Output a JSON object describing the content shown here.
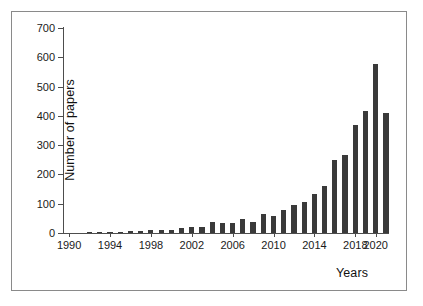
{
  "chart_data": {
    "type": "bar",
    "title": "",
    "xlabel": "Years",
    "ylabel": "Number of papers",
    "ylim": [
      0,
      700
    ],
    "ytick_values": [
      0,
      100,
      200,
      300,
      400,
      500,
      600,
      700
    ],
    "ytick_labels": [
      "0",
      "100",
      "200",
      "300",
      "400",
      "500",
      "600",
      "700"
    ],
    "xtick_labels": [
      "1990",
      "1994",
      "1998",
      "2002",
      "2006",
      "2010",
      "2014",
      "2018",
      "2020"
    ],
    "xtick_years": [
      1990,
      1994,
      1998,
      2002,
      2006,
      2010,
      2014,
      2018,
      2020
    ],
    "xlim": [
      1989.4,
      2021.2
    ],
    "grid": false,
    "legend": null,
    "bar_color": "#3a3a3a",
    "axis_color": "#4d4d4d",
    "frame_color": "#8a8a8a",
    "background": "#ffffff",
    "categories": [
      "1990",
      "1991",
      "1992",
      "1993",
      "1994",
      "1995",
      "1996",
      "1997",
      "1998",
      "1999",
      "2000",
      "2001",
      "2002",
      "2003",
      "2004",
      "2005",
      "2006",
      "2007",
      "2008",
      "2009",
      "2010",
      "2011",
      "2012",
      "2013",
      "2014",
      "2015",
      "2016",
      "2017",
      "2018",
      "2019",
      "2020",
      "2021"
    ],
    "values": [
      0,
      0,
      1,
      4,
      5,
      4,
      8,
      8,
      9,
      10,
      11,
      18,
      20,
      22,
      38,
      33,
      33,
      48,
      38,
      65,
      57,
      80,
      97,
      107,
      132,
      160,
      248,
      265,
      370,
      415,
      577,
      410
    ]
  }
}
